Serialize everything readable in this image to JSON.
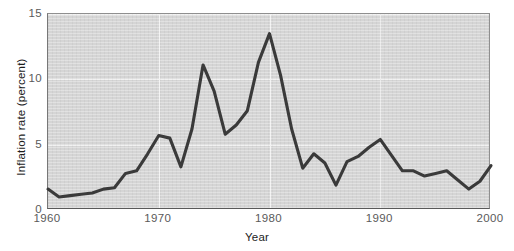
{
  "chart_data": {
    "type": "line",
    "title": "",
    "xlabel": "Year",
    "ylabel": "Inflation rate (percent)",
    "xlim": [
      1960,
      2000
    ],
    "ylim": [
      0,
      15
    ],
    "xticks": [
      1960,
      1970,
      1980,
      1990,
      2000
    ],
    "yticks": [
      0,
      5,
      10,
      15
    ],
    "xtick_labels": [
      "1960",
      "1970",
      "1980",
      "1990",
      "2000"
    ],
    "ytick_labels": [
      "0",
      "5",
      "10",
      "15"
    ],
    "grid": true,
    "legend": "none",
    "series": [
      {
        "name": "Inflation rate",
        "color": "#3a3a3a",
        "x": [
          1960,
          1961,
          1962,
          1963,
          1964,
          1965,
          1966,
          1967,
          1968,
          1969,
          1970,
          1971,
          1972,
          1973,
          1974,
          1975,
          1976,
          1977,
          1978,
          1979,
          1980,
          1981,
          1982,
          1983,
          1984,
          1985,
          1986,
          1987,
          1988,
          1989,
          1990,
          1991,
          1992,
          1993,
          1994,
          1995,
          1996,
          1997,
          1998,
          1999,
          2000
        ],
        "values": [
          1.6,
          1.0,
          1.1,
          1.2,
          1.3,
          1.6,
          1.7,
          2.8,
          3.0,
          4.3,
          5.7,
          5.5,
          3.3,
          6.2,
          11.1,
          9.1,
          5.8,
          6.5,
          7.6,
          11.3,
          13.5,
          10.3,
          6.2,
          3.2,
          4.3,
          3.6,
          1.9,
          3.7,
          4.1,
          4.8,
          5.4,
          4.2,
          3.0,
          3.0,
          2.6,
          2.8,
          3.0,
          2.3,
          1.6,
          2.2,
          3.4
        ]
      }
    ]
  }
}
